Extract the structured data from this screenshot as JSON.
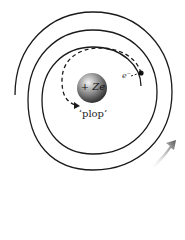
{
  "diagram": {
    "nucleus_label": "+ Ze",
    "electron_label": "e⁻",
    "caption": "‘plop’",
    "colors": {
      "line": "#1a1a1a",
      "nucleus_light": "#f2f2f2",
      "nucleus_dark": "#3a3a3a",
      "arrow": "#5a5a5a",
      "background": "#ffffff"
    }
  }
}
